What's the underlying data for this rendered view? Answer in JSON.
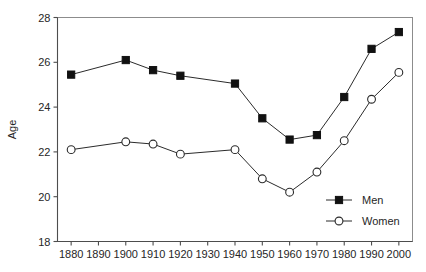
{
  "chart_data": {
    "type": "line",
    "title": "",
    "subtitle": "",
    "xlabel": "",
    "ylabel": "Age",
    "x": [
      1880,
      1890,
      1900,
      1910,
      1920,
      1930,
      1940,
      1950,
      1960,
      1970,
      1980,
      1990,
      2000
    ],
    "xtick_labels": [
      "1880",
      "1890",
      "1900",
      "1910",
      "1920",
      "1930",
      "1940",
      "1950",
      "1960",
      "1970",
      "1980",
      "1990",
      "2000"
    ],
    "ytick_labels": [
      "18",
      "20",
      "22",
      "24",
      "26",
      "28"
    ],
    "yticks": [
      18,
      20,
      22,
      24,
      26,
      28
    ],
    "xlim": [
      1875,
      2005
    ],
    "ylim": [
      18,
      28
    ],
    "grid": false,
    "legend_position": "inside-bottom-right",
    "series": [
      {
        "name": "Men",
        "marker": "filled-square",
        "color": "#111111",
        "x": [
          1880,
          1900,
          1910,
          1920,
          1940,
          1950,
          1960,
          1970,
          1980,
          1990,
          2000
        ],
        "values": [
          25.45,
          26.1,
          25.65,
          25.4,
          25.05,
          23.5,
          22.55,
          22.75,
          24.45,
          26.6,
          27.35
        ]
      },
      {
        "name": "Women",
        "marker": "open-circle",
        "color": "#ffffff",
        "x": [
          1880,
          1900,
          1910,
          1920,
          1940,
          1950,
          1960,
          1970,
          1980,
          1990,
          2000
        ],
        "values": [
          22.1,
          22.45,
          22.35,
          21.9,
          22.1,
          20.8,
          20.2,
          21.1,
          22.5,
          24.35,
          25.55
        ]
      }
    ],
    "legend": [
      {
        "label": "Men",
        "marker": "filled-square"
      },
      {
        "label": "Women",
        "marker": "open-circle"
      }
    ]
  }
}
